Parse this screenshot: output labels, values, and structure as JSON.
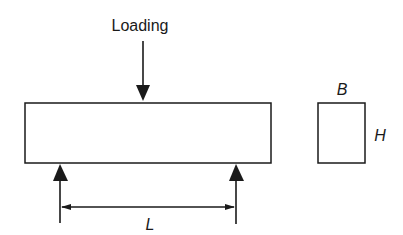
{
  "diagram": {
    "load_label": "Loading",
    "span_label": "L",
    "width_label": "B",
    "height_label": "H",
    "colors": {
      "line": "#1a1a1a",
      "background": "#ffffff"
    }
  }
}
